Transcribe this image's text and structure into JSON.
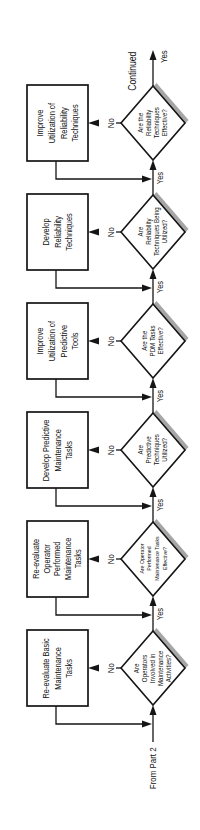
{
  "diagram": {
    "entry_label": "From Part 2",
    "exit_label": "Continued",
    "steps": [
      {
        "decision": "Are\nOperators\nInvolved in\nMaintenance\nActivities?",
        "action": "Re-evaluate Basic\nMaintenance\nTasks",
        "no_label": "No",
        "yes_label": "Yes"
      },
      {
        "decision": "Are Operator\nPerformed\nMaintenance Tasks\nEffective?",
        "action": "Re-evaluate\nOperator\nPerformed\nMaintenance\nTasks",
        "no_label": "No",
        "yes_label": "Yes"
      },
      {
        "decision": "Are\nPredictive\nTechniques\nUtilized?",
        "action": "Develop Predictive\nMaintenance\nTasks",
        "no_label": "No",
        "yes_label": "Yes"
      },
      {
        "decision": "Are the\nPDM Tasks\nEffective?",
        "action": "Improve\nUtilization of\nPredictive\nTools",
        "no_label": "No",
        "yes_label": "Yes"
      },
      {
        "decision": "Are\nReliability\nTechniques Being\nUtilized?",
        "action": "Develop\nReliability\nTechniques",
        "no_label": "No",
        "yes_label": "Yes"
      },
      {
        "decision": "Are the\nReliability\nTechniques\nEffective?",
        "action": "Improve\nUtilization of\nReliability\nTechniques",
        "no_label": "No",
        "yes_label": "Yes"
      }
    ]
  },
  "colors": {
    "line": "#151515",
    "shadow": "#a6a6a6",
    "background": "#ffffff"
  }
}
